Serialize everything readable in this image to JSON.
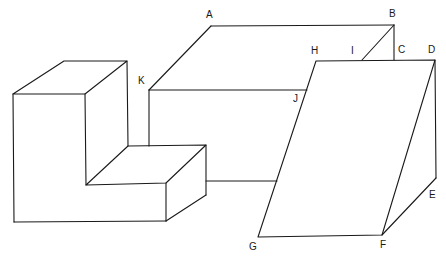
{
  "figure": {
    "type": "line-drawing",
    "stroke_color": "#1a1a1a",
    "background": "#ffffff"
  },
  "labels": {
    "A": "A",
    "B": "B",
    "C": "C",
    "D": "D",
    "E": "E",
    "F": "F",
    "G": "G",
    "H": "H",
    "I": "I",
    "J": "J",
    "K": "K"
  },
  "points": {
    "A": [
      211,
      26
    ],
    "B": [
      394,
      25
    ],
    "C": [
      394,
      60
    ],
    "D": [
      435,
      60
    ],
    "E": [
      436,
      178
    ],
    "F": [
      382,
      235
    ],
    "G": [
      258,
      237
    ],
    "H": [
      316,
      61
    ],
    "I": [
      362,
      60
    ],
    "J": [
      307,
      90
    ],
    "K": [
      149,
      90
    ]
  }
}
